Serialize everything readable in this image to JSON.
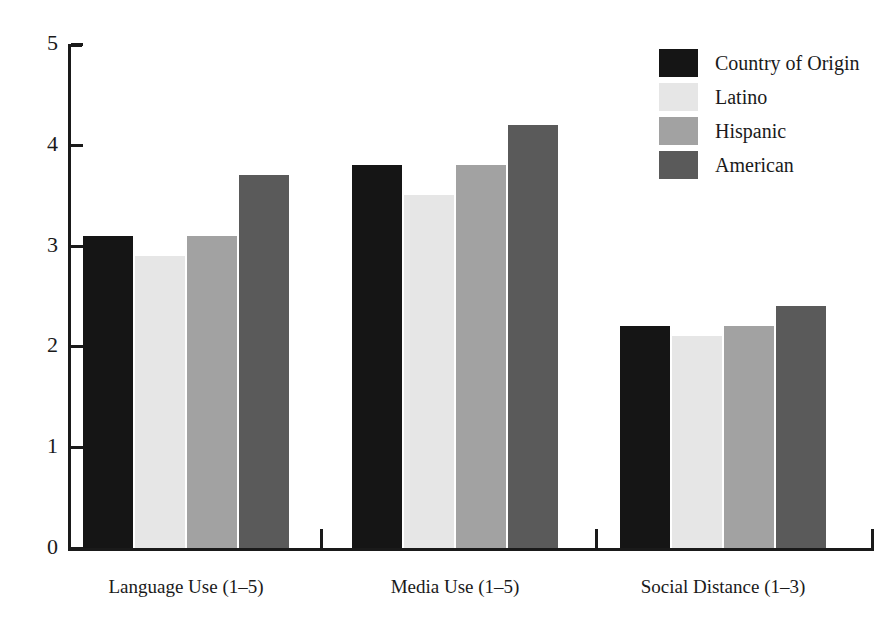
{
  "chart_data": {
    "type": "bar",
    "title": "",
    "subtitle": "",
    "xlabel": "",
    "ylabel": "",
    "ylim": [
      0,
      5
    ],
    "yticks": [
      "0",
      "1",
      "2",
      "3",
      "4",
      "5"
    ],
    "grid": false,
    "legend_position": "top-right",
    "categories": [
      "Language Use (1–5)",
      "Media Use (1–5)",
      "Social Distance (1–3)"
    ],
    "series": [
      {
        "name": "Country of Origin",
        "color": "#151515",
        "values": [
          3.1,
          3.8,
          2.2
        ]
      },
      {
        "name": "Latino",
        "color": "#e6e6e6",
        "values": [
          2.9,
          3.5,
          2.1
        ]
      },
      {
        "name": "Hispanic",
        "color": "#a2a2a2",
        "values": [
          3.1,
          3.8,
          2.2
        ]
      },
      {
        "name": "American",
        "color": "#5a5a5a",
        "values": [
          3.7,
          4.2,
          2.4
        ]
      }
    ]
  },
  "legend": {
    "items": [
      {
        "label": "Country of Origin",
        "color": "#151515"
      },
      {
        "label": "Latino",
        "color": "#e6e6e6"
      },
      {
        "label": "Hispanic",
        "color": "#a2a2a2"
      },
      {
        "label": "American",
        "color": "#5a5a5a"
      }
    ]
  },
  "axes": {
    "y_tick_labels": [
      "5",
      "4",
      "3",
      "2",
      "1",
      "0"
    ],
    "x_group_labels": [
      "Language Use (1–5)",
      "Media Use (1–5)",
      "Social Distance (1–3)"
    ]
  }
}
